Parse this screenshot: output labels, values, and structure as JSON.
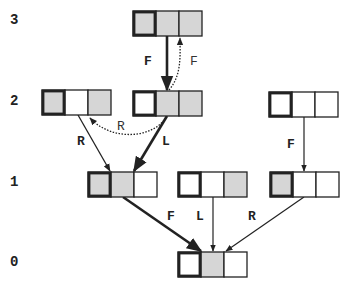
{
  "colors": {
    "shaded": "#d6d6d6",
    "white": "#ffffff",
    "stroke": "#222222"
  },
  "levels": [
    {
      "id": "3",
      "label": "3"
    },
    {
      "id": "2",
      "label": "2"
    },
    {
      "id": "1",
      "label": "1"
    },
    {
      "id": "0",
      "label": "0"
    }
  ],
  "nodes": [
    {
      "id": "n3",
      "level": "3",
      "cells": [
        true,
        true,
        true
      ]
    },
    {
      "id": "n2a",
      "level": "2",
      "cells": [
        true,
        false,
        true
      ]
    },
    {
      "id": "n2b",
      "level": "2",
      "cells": [
        false,
        true,
        true
      ]
    },
    {
      "id": "n2c",
      "level": "2",
      "cells": [
        false,
        false,
        false
      ]
    },
    {
      "id": "n1a",
      "level": "1",
      "cells": [
        true,
        true,
        false
      ]
    },
    {
      "id": "n1b",
      "level": "1",
      "cells": [
        false,
        false,
        true
      ]
    },
    {
      "id": "n1c",
      "level": "1",
      "cells": [
        true,
        false,
        false
      ]
    },
    {
      "id": "n0",
      "level": "0",
      "cells": [
        false,
        true,
        false
      ]
    }
  ],
  "edges": [
    {
      "id": "e1",
      "from": "n3",
      "to": "n2b",
      "label": "F",
      "style": "thick"
    },
    {
      "id": "e2",
      "from": "n2b",
      "to": "n3",
      "label": "F",
      "style": "dotted"
    },
    {
      "id": "e3",
      "from": "n2a",
      "to": "n1a",
      "label": "R",
      "style": "thin"
    },
    {
      "id": "e4",
      "from": "n2b",
      "to": "n1a",
      "label": "L",
      "style": "thick"
    },
    {
      "id": "e5",
      "from": "n2b",
      "to": "n2a",
      "label": "R",
      "style": "dotted"
    },
    {
      "id": "e6",
      "from": "n2c",
      "to": "n1c",
      "label": "F",
      "style": "thin"
    },
    {
      "id": "e7",
      "from": "n1a",
      "to": "n0",
      "label": "F",
      "style": "thick"
    },
    {
      "id": "e8",
      "from": "n1b",
      "to": "n0",
      "label": "L",
      "style": "thin"
    },
    {
      "id": "e9",
      "from": "n1c",
      "to": "n0",
      "label": "R",
      "style": "thin"
    }
  ]
}
